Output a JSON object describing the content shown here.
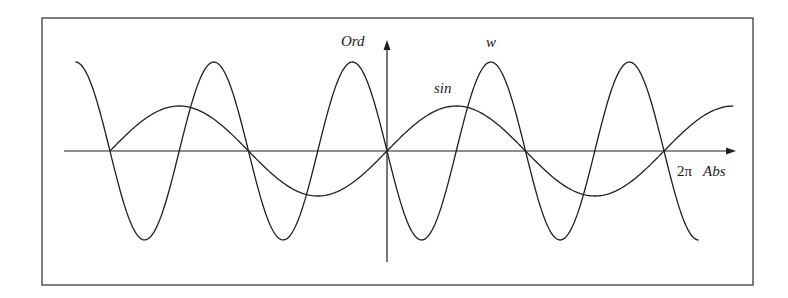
{
  "chart_data": {
    "type": "line",
    "title": "",
    "xlabel": "Abs",
    "ylabel": "Ord",
    "x_tick_labels": [
      "2π"
    ],
    "x_range": [
      -7.07,
      7.85
    ],
    "y_range": [
      -2.0,
      2.0
    ],
    "grid": false,
    "legend": "inline labels",
    "series": [
      {
        "name": "sin",
        "label": "sin",
        "expression": "sin(x)",
        "x_start": -6.283,
        "x_end": 7.854,
        "x": [
          -6.283,
          -4.712,
          -3.142,
          -1.571,
          0,
          1.571,
          3.142,
          4.712,
          6.283,
          7.854
        ],
        "values": [
          0,
          1,
          0,
          -1,
          0,
          1,
          0,
          -1,
          0,
          1
        ]
      },
      {
        "name": "w",
        "label": "w",
        "expression": "-2 sin(2x)",
        "x_start": -7.069,
        "x_end": 7.069,
        "x": [
          -7.069,
          -6.283,
          -5.498,
          -4.712,
          -3.927,
          -3.142,
          -2.356,
          -1.571,
          -0.785,
          0,
          0.785,
          1.571,
          2.356,
          3.142,
          3.927,
          4.712,
          5.498,
          6.283,
          7.069
        ],
        "values": [
          2,
          0,
          -2,
          0,
          2,
          0,
          -2,
          0,
          2,
          0,
          -2,
          0,
          2,
          0,
          -2,
          0,
          2,
          0,
          -2
        ]
      }
    ]
  },
  "labels": {
    "y_axis": "Ord",
    "x_axis": "Abs",
    "x_tick": "2π",
    "curve_w": "w",
    "curve_sin": "sin"
  },
  "layout": {
    "origin_px": [
      387,
      151
    ],
    "px_per_unit_x": 44.09,
    "px_per_unit_y_sin": 45,
    "px_per_unit_y_w": 44.5
  }
}
